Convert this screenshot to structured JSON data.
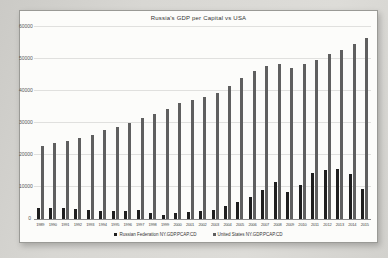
{
  "page": {
    "background_color": "#d6d5d1",
    "panel_color": "#fcfcfa"
  },
  "chart_data": {
    "type": "bar",
    "title": "Russia's GDP per Capital vs USA",
    "xlabel": "",
    "ylabel": "",
    "ylim": [
      0,
      60000
    ],
    "yticks": [
      0,
      10000,
      20000,
      30000,
      40000,
      50000,
      60000
    ],
    "grid": true,
    "legend_position": "bottom",
    "categories": [
      "1989",
      "1990",
      "1991",
      "1992",
      "1993",
      "1994",
      "1995",
      "1996",
      "1997",
      "1998",
      "1999",
      "2000",
      "2001",
      "2002",
      "2003",
      "2004",
      "2005",
      "2006",
      "2007",
      "2008",
      "2009",
      "2010",
      "2011",
      "2012",
      "2013",
      "2014",
      "2015"
    ],
    "series": [
      {
        "name": "Russian Federation NY.GDP.PCAP.CD",
        "color": "#1f1f1f",
        "values": [
          3429,
          3485,
          3427,
          3095,
          2929,
          2662,
          2666,
          2644,
          2738,
          1835,
          1331,
          1772,
          2100,
          2375,
          2975,
          4102,
          5323,
          6920,
          9101,
          11635,
          8563,
          10675,
          14311,
          15421,
          15545,
          14126,
          9313
        ]
      },
      {
        "name": "United States NY.GDP.PCAP.CD",
        "color": "#5f5f5f",
        "values": [
          22857,
          23889,
          24342,
          25419,
          26387,
          27695,
          28691,
          29968,
          31459,
          32854,
          34514,
          36330,
          37134,
          38023,
          39496,
          41713,
          44115,
          46299,
          47976,
          48383,
          47100,
          48375,
          49793,
          51450,
          52787,
          54696,
          56443
        ]
      }
    ]
  }
}
